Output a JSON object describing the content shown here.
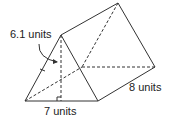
{
  "diagram": {
    "type": "triangular-prism",
    "labels": {
      "height": "6.1 units",
      "base": "7 units",
      "length": "8 units"
    },
    "stroke_color": "#333333"
  }
}
